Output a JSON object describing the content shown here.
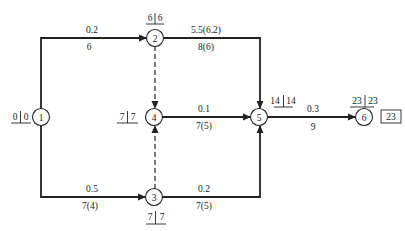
{
  "colors": {
    "stroke": "#222222",
    "background": "#ffffff",
    "text": "#222222"
  },
  "nodes": [
    {
      "id": "1",
      "cx": 41,
      "cy": 117,
      "time_label": {
        "left": "0",
        "right": "0",
        "x": 20,
        "y": 120
      }
    },
    {
      "id": "2",
      "cx": 155,
      "cy": 38,
      "time_label": {
        "left": "6",
        "right": "6",
        "x": 155,
        "y": 21
      }
    },
    {
      "id": "3",
      "cx": 154,
      "cy": 197,
      "time_label": {
        "left": "7",
        "right": "7",
        "x": 155,
        "y": 220
      }
    },
    {
      "id": "4",
      "cx": 154,
      "cy": 117,
      "time_label": {
        "left": "7",
        "right": "7",
        "x": 127,
        "y": 120
      }
    },
    {
      "id": "5",
      "cx": 259,
      "cy": 117,
      "time_label": {
        "left": "14",
        "right": "14",
        "x": 281,
        "y": 104
      }
    },
    {
      "id": "6",
      "cx": 364,
      "cy": 117,
      "time_label": {
        "left": "23",
        "right": "23",
        "x": 364,
        "y": 104
      }
    }
  ],
  "activities": [
    {
      "from": "1",
      "to": "2",
      "top": "0.2",
      "bottom": "6",
      "dashed": false
    },
    {
      "from": "2",
      "to": "5",
      "top": "5.5(6.2)",
      "bottom": "8(6)",
      "dashed": false
    },
    {
      "from": "1",
      "to": "3",
      "top": "0.5",
      "bottom": "7(4)",
      "dashed": false
    },
    {
      "from": "3",
      "to": "5",
      "top": "0.2",
      "bottom": "7(5)",
      "dashed": false
    },
    {
      "from": "4",
      "to": "5",
      "top": "0.1",
      "bottom": "7(5)",
      "dashed": false
    },
    {
      "from": "5",
      "to": "6",
      "top": "0.3",
      "bottom": "9",
      "dashed": false
    },
    {
      "from": "2",
      "to": "4",
      "top": "",
      "bottom": "",
      "dashed": true
    },
    {
      "from": "3",
      "to": "4",
      "top": "",
      "bottom": "",
      "dashed": true
    }
  ],
  "labels": {
    "a12_top": "0.2",
    "a12_bottom": "6",
    "a25_top": "5.5(6.2)",
    "a25_bottom": "8(6)",
    "a13_top": "0.5",
    "a13_bottom": "7(4)",
    "a35_top": "0.2",
    "a35_bottom": "7(5)",
    "a45_top": "0.1",
    "a45_bottom": "7(5)",
    "a56_top": "0.3",
    "a56_bottom": "9",
    "n1": "1",
    "n2": "2",
    "n3": "3",
    "n4": "4",
    "n5": "5",
    "n6": "6",
    "t1_l": "0",
    "t1_r": "0",
    "t2_l": "6",
    "t2_r": "6",
    "t3_l": "7",
    "t3_r": "7",
    "t4_l": "7",
    "t4_r": "7",
    "t5_l": "14",
    "t5_r": "14",
    "t6_l": "23",
    "t6_r": "23",
    "total_duration": "23"
  }
}
